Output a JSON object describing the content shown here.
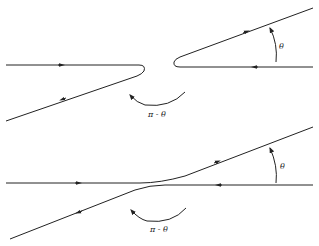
{
  "diagram": {
    "top_panel": {
      "angle_label": "θ",
      "deflection_label": "π - θ"
    },
    "bottom_panel": {
      "angle_label": "θ",
      "deflection_label": "π - θ"
    },
    "colors": {
      "stroke": "#222222",
      "background": "#ffffff"
    }
  }
}
